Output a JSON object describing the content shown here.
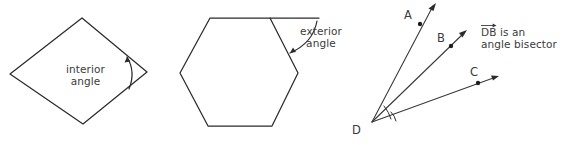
{
  "figure": {
    "background_color": "#ffffff",
    "stroke_color": "#2b2b2b",
    "text_color": "#3b3b3b"
  },
  "panels": [
    {
      "id": "interior-angle-panel",
      "shape": "quadrilateral",
      "annotation_line1": "interior",
      "annotation_line2": "angle",
      "vertices": [
        [
          82,
          18
        ],
        [
          147,
          72
        ],
        [
          83,
          124
        ],
        [
          10,
          74
        ]
      ],
      "marked_vertex": [
        147,
        72
      ]
    },
    {
      "id": "exterior-angle-panel",
      "shape": "hexagon",
      "annotation_line1": "exterior",
      "annotation_line2": "angle",
      "vertices": [
        [
          210,
          18
        ],
        [
          270,
          18
        ],
        [
          298,
          73
        ],
        [
          272,
          126
        ],
        [
          208,
          126
        ],
        [
          180,
          73
        ]
      ],
      "extended_ray_from": [
        270,
        18
      ],
      "extended_ray_to": [
        319,
        18
      ],
      "marked_vertex": [
        270,
        18
      ]
    },
    {
      "id": "angle-bisector-panel",
      "shape": "three-rays",
      "vertex_label": "D",
      "ray_labels": [
        "A",
        "B",
        "C"
      ],
      "note_ray": "DB",
      "note_line1": "is an",
      "note_line2": "angle bisector",
      "vertex": [
        372,
        122
      ],
      "rays": [
        {
          "label": "A",
          "label_pos": [
            404,
            9
          ],
          "dot": [
            420,
            24
          ],
          "tip": [
            436,
            4
          ]
        },
        {
          "label": "B",
          "label_pos": [
            437,
            32
          ],
          "dot": [
            451,
            46
          ],
          "tip": [
            467,
            30
          ]
        },
        {
          "label": "C",
          "label_pos": [
            470,
            66
          ],
          "dot": [
            478,
            83
          ],
          "tip": [
            499,
            76
          ]
        }
      ]
    }
  ]
}
